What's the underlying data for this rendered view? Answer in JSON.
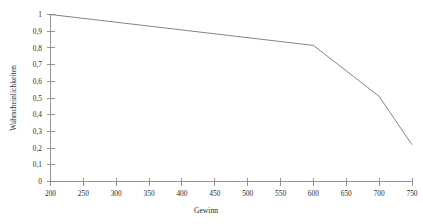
{
  "chart_data": {
    "type": "line",
    "title": "",
    "xlabel": "Gewinn",
    "ylabel": "Wahrscheinlichkeiten",
    "xlim": [
      200,
      750
    ],
    "ylim": [
      0,
      1
    ],
    "grid": false,
    "legend": false,
    "decimal_separator": ",",
    "x_ticks": [
      200,
      250,
      300,
      350,
      400,
      450,
      500,
      550,
      600,
      650,
      700,
      750
    ],
    "x_tick_labels": [
      "200",
      "250",
      "300",
      "350",
      "400",
      "450",
      "500",
      "550",
      "600",
      "650",
      "700",
      "750"
    ],
    "y_ticks": [
      0,
      0.1,
      0.2,
      0.3,
      0.4,
      0.5,
      0.6,
      0.7,
      0.8,
      0.9,
      1
    ],
    "y_tick_labels": [
      "0",
      "0,1",
      "0,2",
      "0,3",
      "0,4",
      "0,5",
      "0,6",
      "0,7",
      "0,8",
      "0,9",
      "1"
    ],
    "series": [
      {
        "name": "Wahrscheinlichkeit",
        "color": "#6e6e6e",
        "x": [
          200,
          600,
          700,
          750
        ],
        "values": [
          1.0,
          0.815,
          0.51,
          0.22
        ]
      }
    ]
  },
  "axes": {
    "x_axis_name": "Gewinn",
    "y_axis_name": "Wahrscheinlichkeiten"
  },
  "colors": {
    "line": "#6e6e6e",
    "axis": "#8a8a8a",
    "text": "#2b2b2b",
    "background": "#ffffff"
  }
}
